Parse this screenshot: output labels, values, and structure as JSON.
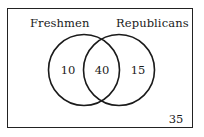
{
  "diagram": {
    "type": "venn",
    "sets": [
      {
        "name": "Freshmen",
        "only_count": "10"
      },
      {
        "name": "Republicans",
        "only_count": "15"
      }
    ],
    "intersection_count": "40",
    "outside_count": "35",
    "colors": {
      "stroke": "#1a1a1a",
      "background": "#ffffff"
    }
  }
}
